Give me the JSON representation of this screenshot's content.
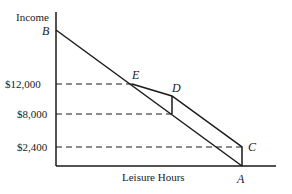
{
  "diagram": {
    "y_axis_label": "Income",
    "x_axis_label": "Leisure Hours",
    "y_ticks": [
      "$12,000",
      "$8,000",
      "$2,400"
    ],
    "points": {
      "A": "A",
      "B": "B",
      "C": "C",
      "D": "D",
      "E": "E"
    },
    "colors": {
      "line": "#1a1a1a",
      "background": "#ffffff"
    }
  }
}
